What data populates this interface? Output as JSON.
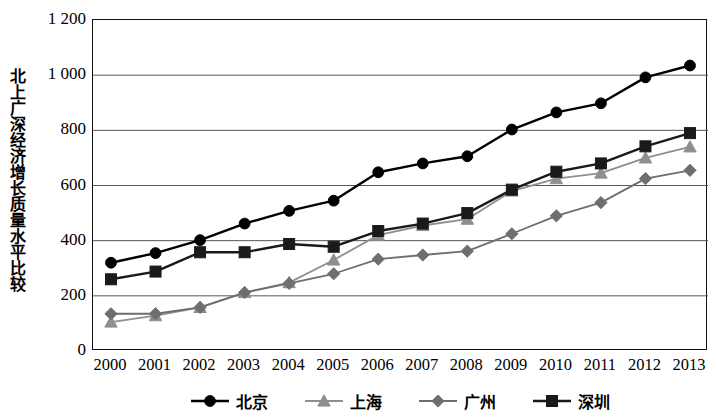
{
  "chart_data": {
    "type": "line",
    "title": "",
    "subtitle": "",
    "xlabel": "",
    "ylabel": "北上广深经济增长质量水平比较",
    "categories": [
      "2000",
      "2001",
      "2002",
      "2003",
      "2004",
      "2005",
      "2006",
      "2007",
      "2008",
      "2009",
      "2010",
      "2011",
      "2012",
      "2013"
    ],
    "x": [
      2000,
      2001,
      2002,
      2003,
      2004,
      2005,
      2006,
      2007,
      2008,
      2009,
      2010,
      2011,
      2012,
      2013
    ],
    "ylim": [
      0,
      1200
    ],
    "xlim": [
      2000,
      2013
    ],
    "ytick_labels": [
      "0",
      "200",
      "400",
      "600",
      "800",
      "1 000",
      "1 200"
    ],
    "ytick_values": [
      0,
      200,
      400,
      600,
      800,
      1000,
      1200
    ],
    "grid": true,
    "grid_axis": "y",
    "legend_position": "bottom",
    "series": [
      {
        "name": "北京",
        "marker": "circle",
        "color": "#000000",
        "values": [
          320,
          355,
          402,
          462,
          508,
          545,
          648,
          680,
          706,
          803,
          865,
          898,
          992,
          1035
        ]
      },
      {
        "name": "上海",
        "marker": "triangle",
        "color": "#8f8f8f",
        "values": [
          105,
          128,
          158,
          212,
          248,
          330,
          420,
          455,
          478,
          580,
          625,
          645,
          700,
          740
        ]
      },
      {
        "name": "广州",
        "marker": "diamond",
        "color": "#6e6e6e",
        "values": [
          135,
          135,
          158,
          212,
          245,
          280,
          333,
          348,
          362,
          425,
          490,
          538,
          625,
          655
        ]
      },
      {
        "name": "深圳",
        "marker": "square",
        "color": "#1a1a1a",
        "values": [
          260,
          288,
          358,
          358,
          388,
          378,
          435,
          462,
          500,
          585,
          650,
          680,
          742,
          790
        ]
      }
    ]
  },
  "axis": {
    "y_ticks": [
      {
        "label": "1 200",
        "value": 1200
      },
      {
        "label": "1 000",
        "value": 1000
      },
      {
        "label": "800",
        "value": 800
      },
      {
        "label": "600",
        "value": 600
      },
      {
        "label": "400",
        "value": 400
      },
      {
        "label": "200",
        "value": 200
      },
      {
        "label": "0",
        "value": 0
      }
    ],
    "x_ticks": [
      "2000",
      "2001",
      "2002",
      "2003",
      "2004",
      "2005",
      "2006",
      "2007",
      "2008",
      "2009",
      "2010",
      "2011",
      "2012",
      "2013"
    ]
  },
  "legend": {
    "items": [
      {
        "label": "北京",
        "marker": "circle",
        "color": "#000000"
      },
      {
        "label": "上海",
        "marker": "triangle",
        "color": "#8f8f8f"
      },
      {
        "label": "广州",
        "marker": "diamond",
        "color": "#6e6e6e"
      },
      {
        "label": "深圳",
        "marker": "square",
        "color": "#1a1a1a"
      }
    ]
  },
  "colors": {
    "beijing": "#000000",
    "shanghai": "#8f8f8f",
    "guangzhou": "#6e6e6e",
    "shenzhen": "#1a1a1a",
    "grid": "#555555",
    "axis": "#111111"
  }
}
